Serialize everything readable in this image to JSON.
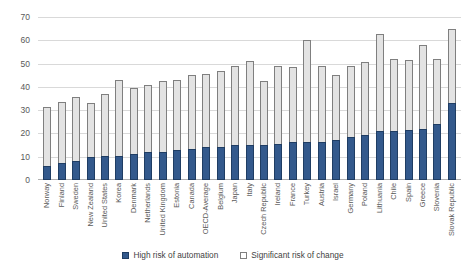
{
  "chart_data": {
    "type": "bar",
    "stacked": true,
    "title": "",
    "xlabel": "",
    "ylabel": "",
    "ylim": [
      0,
      70
    ],
    "yticks": [
      0,
      10,
      20,
      30,
      40,
      50,
      60,
      70
    ],
    "grid": true,
    "legend_position": "bottom",
    "categories": [
      "Norway",
      "Finland",
      "Sweden",
      "New Zealand",
      "United States",
      "Korea",
      "Denmark",
      "Netherlands",
      "United Kingdom",
      "Estonia",
      "Canada",
      "OECD-Average",
      "Belgium",
      "Japan",
      "Italy",
      "Czech Republic",
      "Ireland",
      "France",
      "Turkey",
      "Austria",
      "Israel",
      "Germany",
      "Poland",
      "Lithuania",
      "Chile",
      "Spain",
      "Greece",
      "Slovenia",
      "Slovak Republic"
    ],
    "series": [
      {
        "name": "High risk of automation",
        "color": "#33598c",
        "values": [
          6,
          7.5,
          8,
          10,
          10.5,
          10.5,
          11,
          12,
          12,
          13,
          13.5,
          14,
          14,
          15,
          15,
          15,
          15.5,
          16.5,
          16.5,
          16.5,
          17,
          18.5,
          19.5,
          21,
          21,
          21.5,
          22,
          24,
          33
        ]
      },
      {
        "name": "Significant risk of change",
        "color": "#e3e3e3",
        "values": [
          25.5,
          26,
          27.5,
          23,
          26.5,
          32.5,
          28.5,
          29,
          30.5,
          30,
          31.5,
          31.5,
          33,
          34,
          36,
          27.5,
          33.5,
          32,
          43.5,
          32.5,
          28,
          30.5,
          31,
          41.5,
          31,
          30,
          36,
          28,
          32
        ]
      }
    ],
    "totals": [
      31.5,
      33.5,
      35.5,
      33,
      37,
      43,
      39.5,
      41,
      42.5,
      43,
      45,
      45.5,
      47,
      49,
      51,
      42.5,
      49,
      48.5,
      60,
      49,
      45,
      49,
      50.5,
      62.5,
      52,
      51.5,
      58,
      52,
      65
    ]
  },
  "legend": {
    "items": [
      {
        "label": "High risk of automation",
        "swatch": "blue"
      },
      {
        "label": "Significant risk of change",
        "swatch": "gray"
      }
    ]
  }
}
